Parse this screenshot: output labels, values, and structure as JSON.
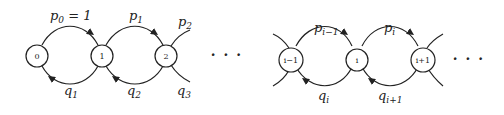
{
  "diagram": {
    "type": "birth-death-chain",
    "nodes": [
      {
        "id": "0",
        "label": "0"
      },
      {
        "id": "1",
        "label": "1"
      },
      {
        "id": "2",
        "label": "2"
      },
      {
        "id": "i-1",
        "label": "i−1"
      },
      {
        "id": "i",
        "label": "i"
      },
      {
        "id": "i+1",
        "label": "i+1"
      }
    ],
    "edges": [
      {
        "from": "0",
        "to": "1",
        "label": "p0 = 1",
        "direction": "forward"
      },
      {
        "from": "1",
        "to": "0",
        "label": "q1",
        "direction": "backward"
      },
      {
        "from": "1",
        "to": "2",
        "label": "p1",
        "direction": "forward"
      },
      {
        "from": "2",
        "to": "1",
        "label": "q2",
        "direction": "backward"
      },
      {
        "from": "2",
        "to": "3",
        "label": "p2",
        "direction": "forward"
      },
      {
        "from": "3",
        "to": "2",
        "label": "q3",
        "direction": "backward"
      },
      {
        "from": "i-1",
        "to": "i",
        "label": "p_{i-1}",
        "direction": "forward"
      },
      {
        "from": "i",
        "to": "i-1",
        "label": "q_i",
        "direction": "backward"
      },
      {
        "from": "i",
        "to": "i+1",
        "label": "p_i",
        "direction": "forward"
      },
      {
        "from": "i+1",
        "to": "i",
        "label": "q_{i+1}",
        "direction": "backward"
      }
    ],
    "ellipsis": [
      "· · ·",
      "· · ·"
    ],
    "labels": {
      "p0": {
        "base": "p",
        "sub": "0",
        "suffix": " = 1"
      },
      "p1": {
        "base": "p",
        "sub": "1"
      },
      "p2": {
        "base": "p",
        "sub": "2"
      },
      "q1": {
        "base": "q",
        "sub": "1"
      },
      "q2": {
        "base": "q",
        "sub": "2"
      },
      "q3": {
        "base": "q",
        "sub": "3"
      },
      "pim1": {
        "base": "p",
        "sub": "i−1"
      },
      "pi": {
        "base": "p",
        "sub": "i"
      },
      "qi": {
        "base": "q",
        "sub": "i"
      },
      "qip1": {
        "base": "q",
        "sub": "i+1"
      }
    },
    "colors": {
      "stroke": "#222222",
      "background": "#ffffff"
    }
  }
}
